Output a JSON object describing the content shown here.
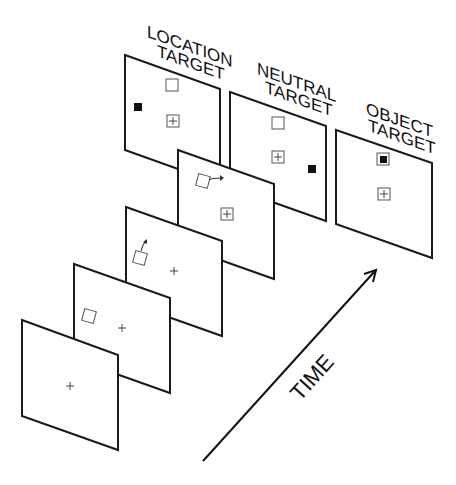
{
  "figure": {
    "title_labels": {
      "location": [
        "LOCATION",
        "TARGET"
      ],
      "neutral": [
        "NEUTRAL",
        "TARGET"
      ],
      "object": [
        "OBJECT",
        "TARGET"
      ]
    },
    "time_axis": {
      "label": "TIME",
      "direction": "arrow-up-right"
    },
    "sequence": [
      {
        "frame": 1,
        "content": "fixation cross"
      },
      {
        "frame": 2,
        "content": "fixation cross + square cue object"
      },
      {
        "frame": 3,
        "content": "fixation cross + square with upward motion arrow"
      },
      {
        "frame": 4,
        "content": "framed fixation cross + square with rightward motion arrow"
      }
    ],
    "target_frames": [
      {
        "name": "location-target",
        "content": "square, framed cross, black target at left"
      },
      {
        "name": "neutral-target",
        "content": "square, framed cross, black target at right"
      },
      {
        "name": "object-target",
        "content": "black target inside square, framed cross"
      }
    ]
  }
}
